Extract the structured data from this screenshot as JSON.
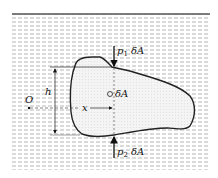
{
  "figure": {
    "labels": {
      "p1_force": {
        "symbol": "p",
        "subscript": "1",
        "suffix": " δA"
      },
      "p2_force": {
        "symbol": "p",
        "subscript": "2",
        "suffix": " δA"
      },
      "element_area": "δA",
      "depth": "h",
      "origin": "O",
      "distance": "x"
    },
    "colors": {
      "fluid_hatch": "#b8b8b8",
      "surface_line": "#555555",
      "body_fill": "#f2f2f2",
      "outline": "#222222"
    }
  }
}
